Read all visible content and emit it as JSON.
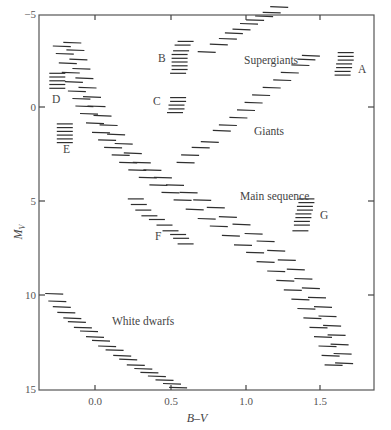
{
  "chart_data": {
    "type": "scatter",
    "title": "",
    "xlabel": "B–V",
    "ylabel": "M_V",
    "xlim": [
      -0.37,
      1.85
    ],
    "ylim": [
      15,
      -5
    ],
    "y_inverted": true,
    "grid": false,
    "legend": "none",
    "x_ticks": [
      0.0,
      0.5,
      1.0,
      1.5
    ],
    "x_tick_labels": [
      "0.0",
      "0.5",
      "1.0",
      "1.5"
    ],
    "y_ticks": [
      -5,
      0,
      5,
      10,
      15
    ],
    "y_tick_labels": [
      "−5",
      "0",
      "5",
      "10",
      "15"
    ],
    "series": [
      {
        "name": "Main sequence",
        "label": "Main sequence",
        "marker": "horizontal-dash",
        "label_pos": {
          "bv": 0.96,
          "mv": 4.9
        },
        "points": [
          {
            "bv": -0.22,
            "mv": -3.2
          },
          {
            "bv": -0.2,
            "mv": -2.8
          },
          {
            "bv": -0.18,
            "mv": -2.3
          },
          {
            "bv": -0.16,
            "mv": -1.8
          },
          {
            "bv": -0.14,
            "mv": -1.3
          },
          {
            "bv": -0.12,
            "mv": -0.8
          },
          {
            "bv": -0.09,
            "mv": -0.4
          },
          {
            "bv": -0.07,
            "mv": 0.0
          },
          {
            "bv": -0.04,
            "mv": 0.4
          },
          {
            "bv": 0.0,
            "mv": 0.9
          },
          {
            "bv": 0.04,
            "mv": 1.4
          },
          {
            "bv": 0.08,
            "mv": 1.8
          },
          {
            "bv": 0.12,
            "mv": 2.2
          },
          {
            "bv": 0.17,
            "mv": 2.6
          },
          {
            "bv": 0.22,
            "mv": 3.0
          },
          {
            "bv": 0.28,
            "mv": 3.4
          },
          {
            "bv": 0.35,
            "mv": 3.8
          },
          {
            "bv": 0.42,
            "mv": 4.2
          },
          {
            "bv": 0.5,
            "mv": 4.6
          },
          {
            "bv": 0.58,
            "mv": 5.0
          },
          {
            "bv": 0.66,
            "mv": 5.5
          },
          {
            "bv": 0.74,
            "mv": 6.0
          },
          {
            "bv": 0.82,
            "mv": 6.4
          },
          {
            "bv": 0.9,
            "mv": 6.9
          },
          {
            "bv": 0.98,
            "mv": 7.4
          },
          {
            "bv": 1.06,
            "mv": 7.8
          },
          {
            "bv": 1.13,
            "mv": 8.3
          },
          {
            "bv": 1.2,
            "mv": 8.8
          },
          {
            "bv": 1.26,
            "mv": 9.3
          },
          {
            "bv": 1.31,
            "mv": 9.8
          },
          {
            "bv": 1.36,
            "mv": 10.3
          },
          {
            "bv": 1.4,
            "mv": 10.8
          },
          {
            "bv": 1.44,
            "mv": 11.3
          },
          {
            "bv": 1.48,
            "mv": 11.8
          },
          {
            "bv": 1.51,
            "mv": 12.3
          },
          {
            "bv": 1.54,
            "mv": 12.8
          },
          {
            "bv": 1.56,
            "mv": 13.3
          },
          {
            "bv": 1.58,
            "mv": 13.8
          }
        ]
      },
      {
        "name": "Main sequence (upper left band)",
        "label": "",
        "marker": "horizontal-dash",
        "points": [
          {
            "bv": -0.15,
            "mv": -3.4
          },
          {
            "bv": -0.13,
            "mv": -3.0
          },
          {
            "bv": -0.11,
            "mv": -2.5
          },
          {
            "bv": -0.09,
            "mv": -2.0
          },
          {
            "bv": -0.07,
            "mv": -1.5
          },
          {
            "bv": -0.05,
            "mv": -1.0
          },
          {
            "bv": -0.02,
            "mv": -0.5
          },
          {
            "bv": 0.01,
            "mv": 0.0
          },
          {
            "bv": 0.05,
            "mv": 0.5
          },
          {
            "bv": 0.09,
            "mv": 1.0
          },
          {
            "bv": 0.14,
            "mv": 1.5
          },
          {
            "bv": 0.19,
            "mv": 2.0
          },
          {
            "bv": 0.25,
            "mv": 2.5
          },
          {
            "bv": 0.31,
            "mv": 3.0
          },
          {
            "bv": 0.38,
            "mv": 3.4
          },
          {
            "bv": 0.45,
            "mv": 3.8
          },
          {
            "bv": 0.53,
            "mv": 4.2
          },
          {
            "bv": 0.62,
            "mv": 4.6
          },
          {
            "bv": 0.71,
            "mv": 5.0
          },
          {
            "bv": 0.8,
            "mv": 5.4
          },
          {
            "bv": 0.88,
            "mv": 5.9
          },
          {
            "bv": 0.97,
            "mv": 6.3
          },
          {
            "bv": 1.05,
            "mv": 6.8
          },
          {
            "bv": 1.13,
            "mv": 7.2
          },
          {
            "bv": 1.2,
            "mv": 7.7
          },
          {
            "bv": 1.27,
            "mv": 8.2
          },
          {
            "bv": 1.33,
            "mv": 8.7
          },
          {
            "bv": 1.38,
            "mv": 9.2
          },
          {
            "bv": 1.43,
            "mv": 9.7
          },
          {
            "bv": 1.47,
            "mv": 10.2
          },
          {
            "bv": 1.51,
            "mv": 10.7
          },
          {
            "bv": 1.54,
            "mv": 11.2
          },
          {
            "bv": 1.57,
            "mv": 11.7
          },
          {
            "bv": 1.6,
            "mv": 12.2
          },
          {
            "bv": 1.62,
            "mv": 12.7
          },
          {
            "bv": 1.64,
            "mv": 13.2
          },
          {
            "bv": 1.65,
            "mv": 13.7
          }
        ]
      },
      {
        "name": "Giants",
        "label": "Giants",
        "marker": "horizontal-dash",
        "label_pos": {
          "bv": 0.93,
          "mv": 1.3
        },
        "points": [
          {
            "bv": 0.6,
            "mv": 3.0
          },
          {
            "bv": 0.63,
            "mv": 2.6
          },
          {
            "bv": 0.7,
            "mv": 2.2
          },
          {
            "bv": 0.76,
            "mv": 1.9
          },
          {
            "bv": 0.84,
            "mv": 1.3
          },
          {
            "bv": 0.88,
            "mv": 1.0
          },
          {
            "bv": 0.95,
            "mv": 0.6
          },
          {
            "bv": 1.0,
            "mv": 0.2
          },
          {
            "bv": 1.05,
            "mv": -0.2
          },
          {
            "bv": 1.1,
            "mv": -0.6
          },
          {
            "bv": 1.17,
            "mv": -1.0
          },
          {
            "bv": 1.24,
            "mv": -1.4
          },
          {
            "bv": 1.29,
            "mv": -1.8
          },
          {
            "bv": 1.36,
            "mv": -2.2
          },
          {
            "bv": 1.4,
            "mv": -2.5
          },
          {
            "bv": 1.43,
            "mv": -2.7
          }
        ]
      },
      {
        "name": "Supergiants",
        "label": "Supergiants",
        "marker": "horizontal-dash",
        "label_pos": {
          "bv": 1.06,
          "mv": -3.0
        },
        "points": [
          {
            "bv": 0.74,
            "mv": -2.9
          },
          {
            "bv": 0.82,
            "mv": -3.3
          },
          {
            "bv": 0.88,
            "mv": -3.6
          },
          {
            "bv": 0.92,
            "mv": -3.9
          },
          {
            "bv": 0.97,
            "mv": -4.1
          },
          {
            "bv": 1.02,
            "mv": -4.4
          },
          {
            "bv": 1.06,
            "mv": -4.6
          },
          {
            "bv": 1.12,
            "mv": -4.8
          },
          {
            "bv": 1.17,
            "mv": -5.0
          },
          {
            "bv": 1.22,
            "mv": -5.3
          }
        ]
      },
      {
        "name": "White dwarfs",
        "label": "White dwarfs",
        "marker": "horizontal-dash",
        "label_pos": {
          "bv": 0.15,
          "mv": 11.5
        },
        "points": [
          {
            "bv": -0.27,
            "mv": 10.0
          },
          {
            "bv": -0.25,
            "mv": 10.4
          },
          {
            "bv": -0.22,
            "mv": 10.7
          },
          {
            "bv": -0.19,
            "mv": 11.0
          },
          {
            "bv": -0.15,
            "mv": 11.3
          },
          {
            "bv": -0.12,
            "mv": 11.5
          },
          {
            "bv": -0.08,
            "mv": 11.8
          },
          {
            "bv": -0.04,
            "mv": 12.0
          },
          {
            "bv": 0.0,
            "mv": 12.3
          },
          {
            "bv": 0.04,
            "mv": 12.5
          },
          {
            "bv": 0.08,
            "mv": 12.8
          },
          {
            "bv": 0.13,
            "mv": 13.0
          },
          {
            "bv": 0.18,
            "mv": 13.3
          },
          {
            "bv": 0.22,
            "mv": 13.5
          },
          {
            "bv": 0.27,
            "mv": 13.8
          },
          {
            "bv": 0.32,
            "mv": 14.0
          },
          {
            "bv": 0.36,
            "mv": 14.2
          },
          {
            "bv": 0.41,
            "mv": 14.4
          },
          {
            "bv": 0.46,
            "mv": 14.6
          },
          {
            "bv": 0.51,
            "mv": 14.8
          },
          {
            "bv": 0.55,
            "mv": 15.0
          }
        ]
      },
      {
        "name": "Cluster A",
        "label": "A",
        "marker": "horizontal-dash",
        "label_pos": {
          "bv": 1.73,
          "mv": -2.2
        },
        "points": [
          {
            "bv": 1.66,
            "mv": -2.9
          },
          {
            "bv": 1.66,
            "mv": -2.7
          },
          {
            "bv": 1.66,
            "mv": -2.5
          },
          {
            "bv": 1.65,
            "mv": -2.3
          },
          {
            "bv": 1.65,
            "mv": -2.1
          },
          {
            "bv": 1.64,
            "mv": -1.9
          },
          {
            "bv": 1.64,
            "mv": -1.7
          }
        ]
      },
      {
        "name": "Cluster B",
        "label": "B",
        "marker": "horizontal-dash",
        "label_pos": {
          "bv": 0.46,
          "mv": -2.6
        },
        "points": [
          {
            "bv": 0.6,
            "mv": -3.5
          },
          {
            "bv": 0.58,
            "mv": -3.3
          },
          {
            "bv": 0.57,
            "mv": -3.0
          },
          {
            "bv": 0.56,
            "mv": -2.8
          },
          {
            "bv": 0.56,
            "mv": -2.6
          },
          {
            "bv": 0.56,
            "mv": -2.4
          },
          {
            "bv": 0.56,
            "mv": -2.2
          },
          {
            "bv": 0.56,
            "mv": -2.0
          },
          {
            "bv": 0.55,
            "mv": -1.8
          }
        ]
      },
      {
        "name": "Cluster C",
        "label": "C",
        "marker": "horizontal-dash",
        "label_pos": {
          "bv": 0.45,
          "mv": 0.1
        },
        "points": [
          {
            "bv": 0.55,
            "mv": -0.5
          },
          {
            "bv": 0.55,
            "mv": -0.3
          },
          {
            "bv": 0.54,
            "mv": -0.1
          },
          {
            "bv": 0.54,
            "mv": 0.1
          },
          {
            "bv": 0.53,
            "mv": 0.3
          }
        ]
      },
      {
        "name": "Cluster D",
        "label": "D",
        "marker": "horizontal-dash",
        "label_pos": {
          "bv": -0.24,
          "mv": -0.6
        },
        "points": [
          {
            "bv": -0.25,
            "mv": -1.8
          },
          {
            "bv": -0.25,
            "mv": -1.6
          },
          {
            "bv": -0.25,
            "mv": -1.4
          },
          {
            "bv": -0.25,
            "mv": -1.2
          },
          {
            "bv": -0.25,
            "mv": -1.0
          }
        ]
      },
      {
        "name": "Cluster E",
        "label": "E",
        "marker": "horizontal-dash",
        "label_pos": {
          "bv": -0.2,
          "mv": 2.1
        },
        "points": [
          {
            "bv": -0.2,
            "mv": 0.9
          },
          {
            "bv": -0.2,
            "mv": 1.1
          },
          {
            "bv": -0.2,
            "mv": 1.3
          },
          {
            "bv": -0.2,
            "mv": 1.5
          },
          {
            "bv": -0.2,
            "mv": 1.7
          },
          {
            "bv": -0.2,
            "mv": 1.9
          }
        ]
      },
      {
        "name": "Cluster F",
        "label": "F",
        "marker": "horizontal-dash",
        "label_pos": {
          "bv": 0.41,
          "mv": 6.8
        },
        "points": [
          {
            "bv": 0.27,
            "mv": 4.9
          },
          {
            "bv": 0.29,
            "mv": 5.2
          },
          {
            "bv": 0.32,
            "mv": 5.5
          },
          {
            "bv": 0.36,
            "mv": 5.8
          },
          {
            "bv": 0.41,
            "mv": 6.0
          },
          {
            "bv": 0.46,
            "mv": 6.3
          },
          {
            "bv": 0.5,
            "mv": 6.6
          },
          {
            "bv": 0.55,
            "mv": 6.8
          },
          {
            "bv": 0.57,
            "mv": 7.0
          },
          {
            "bv": 0.6,
            "mv": 7.3
          }
        ]
      },
      {
        "name": "Cluster G",
        "label": "G",
        "marker": "horizontal-dash",
        "label_pos": {
          "bv": 1.48,
          "mv": 5.7
        },
        "points": [
          {
            "bv": 1.4,
            "mv": 4.9
          },
          {
            "bv": 1.4,
            "mv": 5.1
          },
          {
            "bv": 1.39,
            "mv": 5.3
          },
          {
            "bv": 1.39,
            "mv": 5.5
          },
          {
            "bv": 1.38,
            "mv": 5.7
          },
          {
            "bv": 1.38,
            "mv": 5.9
          },
          {
            "bv": 1.37,
            "mv": 6.1
          },
          {
            "bv": 1.37,
            "mv": 6.3
          },
          {
            "bv": 1.36,
            "mv": 6.6
          }
        ]
      }
    ]
  },
  "axes": {
    "x_title": "B–V",
    "y_title_main": "M",
    "y_title_sub": "V",
    "x_tick_labels": [
      "0.0",
      "0.5",
      "1.0",
      "1.5"
    ],
    "y_tick_labels": [
      "−5",
      "0",
      "5",
      "10",
      "15"
    ]
  },
  "labels": {
    "main_sequence": "Main sequence",
    "giants": "Giants",
    "supergiants": "Supergiants",
    "white_dwarfs": "White dwarfs",
    "A": "A",
    "B": "B",
    "C": "C",
    "D": "D",
    "E": "E",
    "F": "F",
    "G": "G"
  },
  "colors": {
    "ink": "#2f2f2f",
    "frame": "#555555",
    "background": "#ffffff"
  }
}
